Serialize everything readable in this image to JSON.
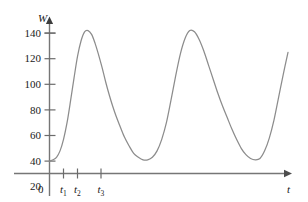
{
  "chart_data": {
    "type": "line",
    "title": "",
    "xlabel": "t",
    "ylabel": "W",
    "grid": false,
    "legend": "none",
    "xlim": [
      0,
      10.5
    ],
    "ylim": [
      0,
      150
    ],
    "yticks": [
      20,
      40,
      60,
      80,
      100,
      120,
      140
    ],
    "ytick_labels": [
      "20",
      "40",
      "60",
      "80",
      "100",
      "120",
      "140"
    ],
    "origin_label": "0",
    "xtick_positions": [
      0.55,
      1.1,
      2.05
    ],
    "xtick_labels": [
      "t",
      "t",
      "t"
    ],
    "xtick_subscripts": [
      "1",
      "2",
      "3"
    ],
    "peak_value": 142,
    "valley_value": 41,
    "start_value": 40,
    "period": 3.6,
    "series": [
      {
        "name": "W(t)",
        "color": "#8c8c8c",
        "x": [
          0.0,
          0.15,
          0.3,
          0.45,
          0.6,
          0.75,
          0.9,
          1.05,
          1.2,
          1.35,
          1.5,
          1.65,
          1.8,
          1.95,
          2.1,
          2.25,
          2.4,
          2.55,
          2.7,
          2.85,
          3.0,
          3.2,
          3.4,
          3.6,
          3.8,
          4.0,
          4.2,
          4.4,
          4.6,
          4.8,
          5.0,
          5.2,
          5.4,
          5.6,
          5.8,
          6.0,
          6.2,
          6.4,
          6.6,
          6.8,
          7.0,
          7.2,
          7.4,
          7.6,
          7.8,
          8.0,
          8.2,
          8.4,
          8.6,
          8.8,
          9.0,
          9.2,
          9.4,
          9.6,
          9.8,
          10.0,
          10.2
        ],
        "y": [
          40,
          41,
          43,
          48,
          57,
          70,
          87,
          105,
          122,
          134,
          141,
          142,
          139,
          132,
          123,
          113,
          102,
          92,
          83,
          75,
          68,
          59,
          52,
          46,
          43,
          41,
          41,
          43,
          48,
          57,
          70,
          88,
          107,
          124,
          136,
          142,
          141,
          135,
          126,
          115,
          104,
          93,
          83,
          74,
          65,
          57,
          50,
          45,
          42,
          41,
          42,
          48,
          58,
          72,
          90,
          108,
          125
        ]
      }
    ]
  },
  "axes": {
    "y_axis_name": "W",
    "x_axis_name": "t",
    "origin": "0"
  }
}
